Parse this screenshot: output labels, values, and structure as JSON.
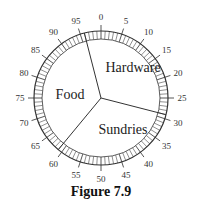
{
  "chart_data": {
    "type": "pie",
    "title": "Figure 7.9",
    "dial": {
      "min": 0,
      "max": 100,
      "major_step": 5,
      "minor_step": 1,
      "labels": [
        0,
        5,
        10,
        15,
        20,
        25,
        30,
        35,
        40,
        45,
        50,
        55,
        60,
        65,
        70,
        75,
        80,
        85,
        90,
        95
      ]
    },
    "slices": [
      {
        "label": "Hardware",
        "start": 96,
        "end": 129,
        "value": 33
      },
      {
        "label": "Sundries",
        "start": 29,
        "end": 61,
        "value": 32
      },
      {
        "label": "Food",
        "start": 61,
        "end": 96,
        "value": 35
      }
    ],
    "categories": [
      "Hardware",
      "Sundries",
      "Food"
    ],
    "values": [
      33,
      32,
      35
    ],
    "boundaries": [
      96,
      29,
      61
    ]
  },
  "caption": "Figure 7.9"
}
